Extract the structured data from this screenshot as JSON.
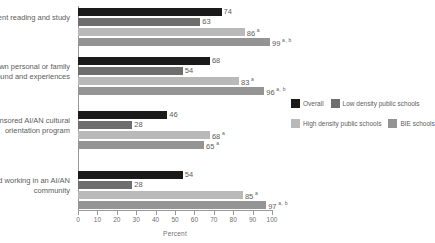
{
  "chart_data": {
    "type": "bar",
    "orientation": "horizontal",
    "title": "",
    "xlabel": "Percent",
    "ylabel": "",
    "xlim": [
      0,
      100
    ],
    "xticks": [
      0,
      10,
      20,
      30,
      40,
      50,
      60,
      70,
      80,
      90,
      100
    ],
    "grid": false,
    "legend_position": "right",
    "categories": [
      "Independent reading and study",
      "Your own personal or family background and experiences",
      "Locally sponsored AI/AN cultural orientation program",
      "Living and working in an AI/AN community"
    ],
    "series": [
      {
        "name": "Overall",
        "color": "#1a1a1a",
        "values": [
          74,
          68,
          46,
          54
        ],
        "labels": [
          "74",
          "68",
          "46",
          "54"
        ],
        "notes": [
          "",
          "",
          "",
          ""
        ]
      },
      {
        "name": "Low density public schools",
        "color": "#6e6e6e",
        "values": [
          63,
          54,
          28,
          28
        ],
        "labels": [
          "63",
          "54",
          "28",
          "28"
        ],
        "notes": [
          "",
          "",
          "",
          ""
        ]
      },
      {
        "name": "High density public schools",
        "color": "#b9b9b9",
        "values": [
          86,
          83,
          68,
          85
        ],
        "labels": [
          "86",
          "83",
          "68",
          "85"
        ],
        "notes": [
          "a",
          "a",
          "a",
          "a"
        ]
      },
      {
        "name": "BIE schools",
        "color": "#949494",
        "values": [
          99,
          96,
          65,
          97
        ],
        "labels": [
          "99",
          "96",
          "65",
          "97"
        ],
        "notes": [
          "a, b",
          "a, b",
          "a",
          "a, b"
        ]
      }
    ]
  },
  "legend": {
    "rows": [
      [
        {
          "label": "Overall",
          "color": "#1a1a1a"
        },
        {
          "label": "Low density public schools",
          "color": "#6e6e6e"
        }
      ],
      [
        {
          "label": "High density public schools",
          "color": "#b9b9b9"
        },
        {
          "label": "BIE schools",
          "color": "#949494"
        }
      ]
    ]
  }
}
